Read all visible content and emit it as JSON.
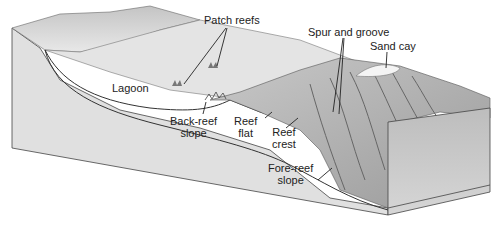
{
  "diagram": {
    "type": "block-diagram",
    "labels": {
      "patch_reefs": "Patch reefs",
      "spur_and_groove": "Spur and groove",
      "sand_cay": "Sand cay",
      "lagoon": "Lagoon",
      "back_reef_slope_1": "Back-reef",
      "back_reef_slope_2": "slope",
      "reef_flat_1": "Reef",
      "reef_flat_2": "flat",
      "reef_crest_1": "Reef",
      "reef_crest_2": "crest",
      "fore_reef_slope_1": "Fore-reef",
      "fore_reef_slope_2": "slope"
    },
    "colors": {
      "background": "#ffffff",
      "land": "#d6d6d6",
      "water_surface": "#e2e2e2",
      "block_side": "#dedede",
      "reef": "#b4b4b4",
      "reef_dark": "#8a8a8a",
      "front_face": "#c8c8c8",
      "line": "#333333"
    }
  }
}
